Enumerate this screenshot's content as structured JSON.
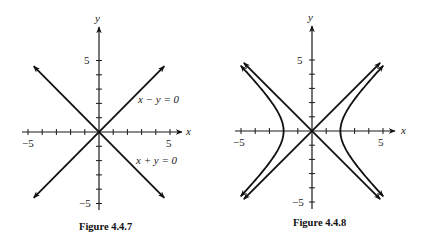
{
  "chart_data": [
    {
      "type": "line",
      "caption": "Figure 4.4.7",
      "xlabel": "x",
      "ylabel": "y",
      "xlim": [
        -5.5,
        5.5
      ],
      "ylim": [
        -5.5,
        5.5
      ],
      "x_tick_labels": [
        {
          "value": -5,
          "label": "−5"
        },
        {
          "value": 5,
          "label": "5"
        }
      ],
      "y_tick_labels": [
        {
          "value": 5,
          "label": "5"
        },
        {
          "value": -5,
          "label": "−5"
        }
      ],
      "ticks_every": 1,
      "grid": false,
      "series": [
        {
          "name": "x − y = 0",
          "kind": "line",
          "points": [
            [
              -4.6,
              -4.6
            ],
            [
              4.6,
              4.6
            ]
          ],
          "arrows": "both"
        },
        {
          "name": "x + y = 0",
          "kind": "line",
          "points": [
            [
              -4.6,
              4.6
            ],
            [
              4.6,
              -4.6
            ]
          ],
          "arrows": "both"
        }
      ],
      "annotations": [
        {
          "text": "x − y = 0",
          "at": [
            3.0,
            2.2
          ]
        },
        {
          "text": "x + y = 0",
          "at": [
            3.0,
            -2.0
          ]
        }
      ]
    },
    {
      "type": "line",
      "caption": "Figure 4.4.8",
      "xlabel": "x",
      "ylabel": "y",
      "xlim": [
        -5.5,
        5.5
      ],
      "ylim": [
        -5.5,
        5.5
      ],
      "x_tick_labels": [
        {
          "value": -5,
          "label": "−5"
        },
        {
          "value": 5,
          "label": "5"
        }
      ],
      "y_tick_labels": [
        {
          "value": 5,
          "label": "5"
        },
        {
          "value": -5,
          "label": "−5"
        }
      ],
      "ticks_every": 1,
      "grid": false,
      "series": [
        {
          "name": "y = x",
          "kind": "line",
          "points": [
            [
              -4.8,
              -4.8
            ],
            [
              4.8,
              4.8
            ]
          ],
          "arrows": "both"
        },
        {
          "name": "y = −x",
          "kind": "line",
          "points": [
            [
              -4.8,
              4.8
            ],
            [
              4.8,
              -4.8
            ]
          ],
          "arrows": "both"
        },
        {
          "name": "x² − y² = 4 (right branch)",
          "kind": "hyperbola",
          "a": 2,
          "branch": 1,
          "y_range": [
            -4.6,
            4.6
          ],
          "arrows": "both"
        },
        {
          "name": "x² − y² = 4 (left branch)",
          "kind": "hyperbola",
          "a": 2,
          "branch": -1,
          "y_range": [
            -4.6,
            4.6
          ],
          "arrows": "both"
        }
      ],
      "annotations": []
    }
  ]
}
